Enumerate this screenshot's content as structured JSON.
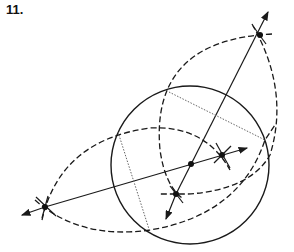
{
  "figure": {
    "label": "11.",
    "colors": {
      "stroke": "#1a1a1a",
      "dotted": "#666666"
    },
    "circle": {
      "cx": 190,
      "cy": 165,
      "r": 79
    },
    "points": {
      "center": [
        191,
        164
      ],
      "top": [
        260,
        35
      ],
      "left": [
        45,
        207
      ],
      "right_inner": [
        222,
        155
      ],
      "bottom_inner": [
        176,
        194
      ]
    },
    "lines": [
      {
        "name": "line-top-bottom",
        "from": [
          166,
          219
        ],
        "to": [
          268,
          12
        ]
      },
      {
        "name": "line-left-right",
        "from": [
          22,
          215
        ],
        "to": [
          247,
          148
        ]
      }
    ],
    "chords": [
      {
        "name": "dotted-chord-upper",
        "from": [
          169,
          92
        ],
        "to": [
          265,
          140
        ]
      },
      {
        "name": "dotted-chord-left",
        "from": [
          118,
          132
        ],
        "to": [
          149,
          229
        ]
      }
    ]
  }
}
